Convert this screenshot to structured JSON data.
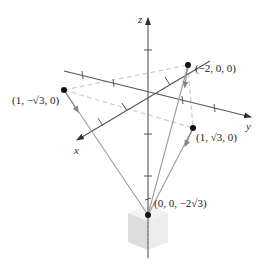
{
  "figure": {
    "axes": {
      "x_label": "x",
      "y_label": "y",
      "z_label": "z"
    },
    "points": [
      {
        "label": "(1, −√3, 0)",
        "name": "point-1-neg-sqrt3-0"
      },
      {
        "label": "(−2, 0, 0)",
        "name": "point-neg2-0-0"
      },
      {
        "label": "(1, √3, 0)",
        "name": "point-1-sqrt3-0"
      },
      {
        "label": "(0, 0, −2√3)",
        "name": "point-0-0-neg2sqrt3"
      }
    ],
    "colors": {
      "axis": "#555555",
      "ray": "#9a9a9a",
      "dashed": "#cccccc",
      "point": "#111111",
      "cube": "#e6e6e6"
    }
  }
}
